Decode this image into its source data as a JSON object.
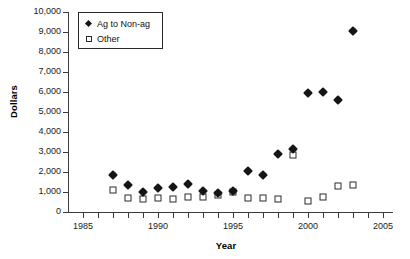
{
  "chart_data": {
    "type": "scatter",
    "title": "",
    "xlabel": "Year",
    "ylabel": "Dollars",
    "xlim": [
      1984,
      2005.6
    ],
    "ylim": [
      0,
      10000
    ],
    "grid": false,
    "legend_position": "top-left",
    "x_ticks": [
      1985,
      1990,
      1995,
      2000,
      2005
    ],
    "x_tick_labels": [
      "1985",
      "1990",
      "1995",
      "2000",
      "2005"
    ],
    "x_minor_tick_step": 1,
    "y_ticks": [
      0,
      1000,
      2000,
      3000,
      4000,
      5000,
      6000,
      7000,
      8000,
      9000,
      10000
    ],
    "y_tick_labels": [
      "0",
      "1,000",
      "2,000",
      "3,000",
      "4,000",
      "5,000",
      "6,000",
      "7,000",
      "8,000",
      "9,000",
      "10,000"
    ],
    "x": [
      1987,
      1988,
      1989,
      1990,
      1991,
      1992,
      1993,
      1994,
      1995,
      1996,
      1997,
      1998,
      1999,
      2000,
      2001,
      2002,
      2003
    ],
    "series": [
      {
        "name": "Ag to Non-ag",
        "marker": "filled-diamond",
        "color": "#151515",
        "values": [
          1850,
          1330,
          1020,
          1210,
          1250,
          1380,
          1030,
          930,
          1060,
          2060,
          1840,
          2890,
          3160,
          5940,
          6000,
          5580,
          9060
        ]
      },
      {
        "name": "Other",
        "marker": "open-square",
        "color": "#2b2b2b",
        "values": [
          1110,
          710,
          650,
          720,
          650,
          750,
          730,
          830,
          990,
          690,
          690,
          640,
          2870,
          530,
          740,
          1310,
          1360
        ]
      }
    ]
  }
}
